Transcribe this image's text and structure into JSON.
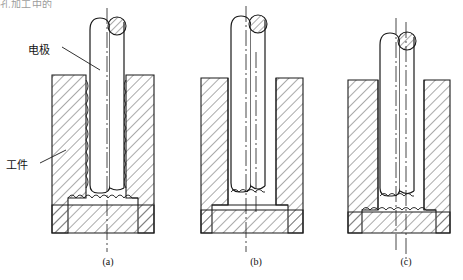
{
  "header": {
    "partial_text": "孔加工中的"
  },
  "labels": {
    "electrode": "电极",
    "workpiece": "工件"
  },
  "captions": {
    "a": "(a)",
    "b": "(b)",
    "c": "(c)"
  },
  "colors": {
    "line": "#1a1a1a",
    "hatch": "#555555",
    "text": "#111111",
    "background": "#ffffff"
  },
  "figures": [
    {
      "id": "a",
      "caption": "(a)",
      "electrode_offset": 0,
      "cavity_clearance": "uniform",
      "centerlines": 1,
      "description": "电极与工件同轴，四周间隙均匀"
    },
    {
      "id": "b",
      "caption": "(b)",
      "electrode_offset": 6,
      "cavity_clearance": "left-biased",
      "centerlines": 2,
      "description": "电极轴线偏移，型腔一侧间隙增大"
    },
    {
      "id": "c",
      "caption": "(c)",
      "electrode_offset": 12,
      "cavity_clearance": "wide-left",
      "centerlines": 2,
      "description": "电极偏移量加大，型腔明显扩张"
    }
  ]
}
